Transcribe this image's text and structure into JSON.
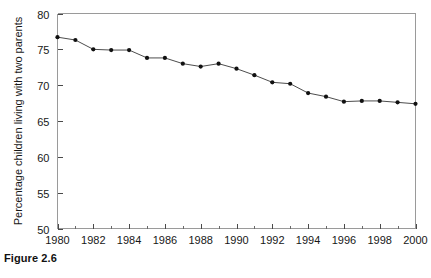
{
  "figure": {
    "caption": "Figure 2.6"
  },
  "chart_data": {
    "type": "line",
    "title": "",
    "subtitle": "",
    "xlabel": "",
    "ylabel": "Percentage children living with two parents",
    "xlim": [
      1980,
      2000
    ],
    "ylim": [
      50,
      80
    ],
    "grid": false,
    "legend": null,
    "x_ticks": [
      1980,
      1982,
      1984,
      1986,
      1988,
      1990,
      1992,
      1994,
      1996,
      1998,
      2000
    ],
    "x_tick_labels": [
      "1980",
      "1982",
      "1984",
      "1986",
      "1988",
      "1990",
      "1992",
      "1994",
      "1996",
      "1998",
      "2000"
    ],
    "x_minor_tick_step": 1,
    "y_ticks": [
      50,
      55,
      60,
      65,
      70,
      75,
      80
    ],
    "y_tick_labels": [
      "50",
      "55",
      "60",
      "65",
      "70",
      "75",
      "80"
    ],
    "x": [
      1980,
      1981,
      1982,
      1983,
      1984,
      1985,
      1986,
      1987,
      1988,
      1989,
      1990,
      1991,
      1992,
      1993,
      1994,
      1995,
      1996,
      1997,
      1998,
      1999,
      2000
    ],
    "values": [
      76.7,
      76.3,
      75.0,
      74.9,
      74.9,
      73.8,
      73.8,
      73.0,
      72.6,
      73.0,
      72.3,
      71.4,
      70.4,
      70.2,
      68.9,
      68.4,
      67.7,
      67.8,
      67.8,
      67.6,
      67.4
    ],
    "series": [
      {
        "name": "Percentage children living with two parents",
        "color": "#4d4d4d",
        "marker": "filled-circle",
        "marker_color": "#111111",
        "values": [
          76.7,
          76.3,
          75.0,
          74.9,
          74.9,
          73.8,
          73.8,
          73.0,
          72.6,
          73.0,
          72.3,
          71.4,
          70.4,
          70.2,
          68.9,
          68.4,
          67.7,
          67.8,
          67.8,
          67.6,
          67.4
        ]
      }
    ]
  },
  "colors": {
    "background": "#ffffff",
    "frame": "#9a9a9a",
    "line": "#4d4d4d",
    "marker": "#111111",
    "text": "#171717"
  }
}
